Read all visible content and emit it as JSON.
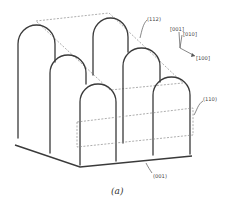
{
  "figure": {
    "caption": "(a)",
    "planes": {
      "p112": "(112)",
      "p110": "(110)",
      "p001": "(001)"
    },
    "axes": {
      "z": "[001]",
      "y": "[010]",
      "x": "[100]"
    },
    "elements": {
      "arches": [
        "back-left",
        "middle-left",
        "front-left",
        "back-right",
        "middle-right",
        "front-right"
      ],
      "base_plane": "(001) substrate"
    },
    "colors": {
      "line": "#3a3a3a",
      "dashed": "#8a8a8a",
      "background": "#ffffff"
    }
  }
}
